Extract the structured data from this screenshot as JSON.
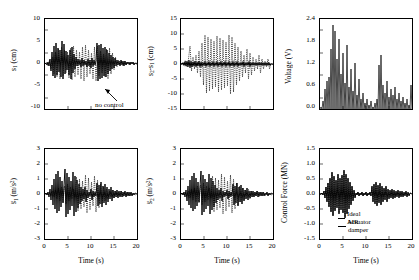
{
  "figure": {
    "title": "",
    "background": "#ffffff",
    "line_color": "#000000",
    "panel_count": 6
  },
  "common": {
    "xlabel": "Time (s)",
    "xticks": [
      "0",
      "5",
      "10",
      "15",
      "20"
    ],
    "xlim": [
      0,
      20
    ]
  },
  "panels": {
    "p1": {
      "name": "displacement-first-floor",
      "ylabel_html": "s<sub>1</sub> (cm)",
      "yticks": [
        "10",
        "5",
        "0",
        "-5",
        "-10"
      ],
      "ylim": [
        -10,
        10
      ],
      "annotation": "no control",
      "show_xticklabels": false,
      "show_xlabel": false
    },
    "p2": {
      "name": "relative-displacement",
      "ylabel_html": "s<sub>2</sub>-s<sub>1</sub> (cm)",
      "yticks": [
        "15",
        "10",
        "5",
        "0",
        "-5",
        "-10",
        "-15"
      ],
      "ylim": [
        -15,
        15
      ],
      "show_xticklabels": false,
      "show_xlabel": false
    },
    "p3": {
      "name": "command-voltage",
      "ylabel_html": "Voltage (V)",
      "yticks": [
        "2.4",
        "1.8",
        "1.2",
        "0.6",
        "0.0"
      ],
      "ylim": [
        0,
        2.4
      ],
      "show_xticklabels": false,
      "show_xlabel": false
    },
    "p4": {
      "name": "acceleration-first-floor",
      "ylabel_html": "s&#776;<sub>1</sub> (m/s<sup>2</sup>)",
      "yticks": [
        "3",
        "2",
        "1",
        "0",
        "-1",
        "-2",
        "-3"
      ],
      "ylim": [
        -3,
        3
      ],
      "show_xticklabels": true,
      "show_xlabel": true
    },
    "p5": {
      "name": "acceleration-second-floor",
      "ylabel_html": "s&#776;<sub>2</sub> (m/s<sup>2</sup>)",
      "yticks": [
        "3",
        "2",
        "1",
        "0",
        "-1",
        "-2",
        "-3"
      ],
      "ylim": [
        -3,
        3
      ],
      "show_xticklabels": true,
      "show_xlabel": true
    },
    "p6": {
      "name": "control-force",
      "ylabel_html": "Control Force (MN)",
      "yticks": [
        "1.5",
        "1.0",
        "0.5",
        "0.0",
        "-0.5",
        "-1.0",
        "-1.5"
      ],
      "ylim": [
        -1.5,
        1.5
      ],
      "show_xticklabels": true,
      "show_xlabel": true,
      "legend": [
        {
          "label": "Ideal Actuator",
          "style": "solid"
        },
        {
          "label": "MR damper",
          "style": "solid"
        }
      ]
    }
  },
  "chart_data": {
    "type": "line",
    "xlabel": "Time (s)",
    "xlim": [
      0,
      20
    ],
    "subplots": [
      {
        "id": "p1",
        "ylabel": "s1 (cm)",
        "ylim": [
          -10,
          10
        ],
        "yticks": [
          -10,
          -5,
          0,
          5,
          10
        ],
        "annotations": [
          "no control"
        ],
        "series": [
          {
            "name": "no control",
            "style": "dotted",
            "x": [
              0,
              0.4,
              0.8,
              1.2,
              1.6,
              2,
              2.4,
              2.8,
              3.2,
              3.6,
              4,
              4.4,
              4.8,
              5.2,
              5.6,
              6,
              6.4,
              6.8,
              7.2,
              7.6,
              8,
              8.4,
              8.8,
              9.2,
              9.6,
              10,
              10.4,
              10.8,
              11.2,
              11.6,
              12,
              12.4,
              12.8,
              13.2,
              13.6,
              14,
              14.4,
              14.8,
              15.2,
              15.6,
              16,
              16.4,
              16.8,
              17.2,
              17.6,
              18,
              18.4,
              18.8,
              19.2,
              19.6,
              20
            ],
            "y": [
              0,
              0.6,
              -1.2,
              2.4,
              -3.6,
              4.8,
              -6.2,
              7.4,
              -7.8,
              6.6,
              -5.4,
              6.8,
              -7.4,
              6.2,
              -5.8,
              6.4,
              -7.2,
              7.0,
              -6.4,
              5.8,
              -6.6,
              7.0,
              -6.8,
              6.2,
              -5.6,
              6.4,
              -7.0,
              6.8,
              -6.0,
              5.4,
              -6.2,
              6.6,
              -6.2,
              5.2,
              -4.6,
              4.0,
              -3.6,
              3.2,
              -2.8,
              2.4,
              -2.0,
              1.8,
              -1.6,
              1.4,
              -1.2,
              1.0,
              -0.9,
              0.8,
              -0.7,
              0.6,
              -0.4
            ]
          },
          {
            "name": "MR damper control",
            "style": "solid",
            "x": [
              0,
              0.4,
              0.8,
              1.2,
              1.6,
              2,
              2.4,
              2.8,
              3.2,
              3.6,
              4,
              4.4,
              4.8,
              5.2,
              5.6,
              6,
              6.4,
              6.8,
              7.2,
              7.6,
              8,
              8.4,
              8.8,
              9.2,
              9.6,
              10,
              10.4,
              10.8,
              11.2,
              11.6,
              12,
              12.4,
              12.8,
              13.2,
              13.6,
              14,
              14.4,
              14.8,
              15.2,
              15.6,
              16,
              16.4,
              16.8,
              17.2,
              17.6,
              18,
              18.4,
              18.8,
              19.2,
              19.6,
              20
            ],
            "y": [
              0,
              1.6,
              -2.0,
              4.8,
              -5.6,
              7.2,
              -6.8,
              7.8,
              -7.2,
              5.2,
              -4.2,
              5.6,
              -6.4,
              4.2,
              -3.0,
              2.4,
              -2.6,
              2.8,
              -2.4,
              2.0,
              -2.2,
              2.6,
              -2.2,
              1.8,
              -1.6,
              2.0,
              -5.4,
              5.8,
              -5.6,
              4.8,
              -5.2,
              5.0,
              -4.2,
              3.4,
              -3.0,
              2.8,
              -3.2,
              3.0,
              -2.6,
              2.2,
              -2.4,
              2.6,
              -2.2,
              1.8,
              -1.6,
              1.4,
              -1.6,
              1.4,
              -1.2,
              1.0,
              -0.6
            ]
          }
        ]
      },
      {
        "id": "p2",
        "ylabel": "s2-s1 (cm)",
        "ylim": [
          -15,
          15
        ],
        "yticks": [
          -15,
          -10,
          -5,
          0,
          5,
          10,
          15
        ],
        "series": [
          {
            "name": "no control",
            "style": "dotted",
            "peak_positive": 13.2,
            "peak_negative": -13.0
          },
          {
            "name": "MR damper control",
            "style": "solid",
            "peak_positive": 2.4,
            "peak_negative": -2.6
          }
        ]
      },
      {
        "id": "p3",
        "ylabel": "Voltage (V)",
        "ylim": [
          0,
          2.4
        ],
        "yticks": [
          0.0,
          0.6,
          1.2,
          1.8,
          2.4
        ],
        "series": [
          {
            "name": "command voltage",
            "style": "solid",
            "peak_positive": 2.28,
            "peak_negative": 0.0
          }
        ]
      },
      {
        "id": "p4",
        "ylabel": "s1-ddot (m/s^2)",
        "ylim": [
          -3,
          3
        ],
        "yticks": [
          -3,
          -2,
          -1,
          0,
          1,
          2,
          3
        ],
        "series": [
          {
            "name": "no control",
            "style": "dotted",
            "peak_positive": 2.0,
            "peak_negative": -2.2
          },
          {
            "name": "MR damper control",
            "style": "solid",
            "peak_positive": 2.3,
            "peak_negative": -2.2
          }
        ]
      },
      {
        "id": "p5",
        "ylabel": "s2-ddot (m/s^2)",
        "ylim": [
          -3,
          3
        ],
        "yticks": [
          -3,
          -2,
          -1,
          0,
          1,
          2,
          3
        ],
        "series": [
          {
            "name": "no control",
            "style": "dotted",
            "peak_positive": 2.0,
            "peak_negative": -2.1
          },
          {
            "name": "MR damper control",
            "style": "solid",
            "peak_positive": 1.9,
            "peak_negative": -2.1
          }
        ]
      },
      {
        "id": "p6",
        "ylabel": "Control Force (MN)",
        "ylim": [
          -1.5,
          1.5
        ],
        "yticks": [
          -1.5,
          -1.0,
          -0.5,
          0.0,
          0.5,
          1.0,
          1.5
        ],
        "legend": [
          "Ideal Actuator",
          "MR damper"
        ],
        "series": [
          {
            "name": "Ideal Actuator",
            "style": "solid",
            "peak_positive": 1.05,
            "peak_negative": -1.0
          },
          {
            "name": "MR damper",
            "style": "solid",
            "peak_positive": 1.05,
            "peak_negative": -1.0
          }
        ]
      }
    ]
  }
}
